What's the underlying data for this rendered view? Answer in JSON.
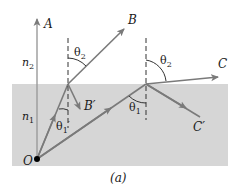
{
  "figure": {
    "caption": "(a)",
    "colors": {
      "background": "#ffffff",
      "medium_lower": "#d6d6d6",
      "ray": "#7a7a7a",
      "normal_dashed": "#333333",
      "text": "#1a1a1a",
      "origin_dot": "#000000"
    },
    "media": {
      "upper_index": "n",
      "upper_index_sub": "2",
      "lower_index": "n",
      "lower_index_sub": "1"
    },
    "points": {
      "origin": "O"
    },
    "rays": {
      "vertical": "A",
      "refracted_1": "B",
      "reflected_1": "B′",
      "refracted_2": "C",
      "reflected_2": "C′"
    },
    "angles": {
      "theta2_left": "θ",
      "theta2_left_sub": "2",
      "theta1_prime": "θ",
      "theta1_prime_sub": "1",
      "theta1_prime_mark": "′",
      "theta2_right": "θ",
      "theta2_right_sub": "2",
      "theta1_right": "θ",
      "theta1_right_sub": "1"
    }
  }
}
